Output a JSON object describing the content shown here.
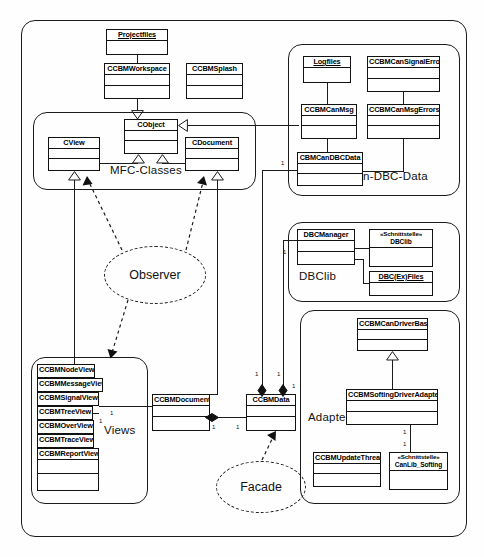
{
  "diagram": {
    "type": "uml-class-diagram",
    "stroke_color": "#1b1b1b",
    "background_color": "#fefefe"
  },
  "packages": [
    {
      "id": "root",
      "label": ""
    },
    {
      "id": "mfc",
      "label": "MFC-Classes"
    },
    {
      "id": "candbc",
      "label": "Can-DBC-Data"
    },
    {
      "id": "dbclib",
      "label": "DBClib"
    },
    {
      "id": "adapter",
      "label": "Adapter"
    },
    {
      "id": "views",
      "label": "Views"
    }
  ],
  "classes": [
    {
      "id": "projectfiles",
      "name": "Projectfiles",
      "stereotype": "",
      "object": true
    },
    {
      "id": "ccbmworkspace",
      "name": "CCBMWorkspace",
      "stereotype": "",
      "object": false
    },
    {
      "id": "ccbmsplash",
      "name": "CCBMSplash",
      "stereotype": "",
      "object": false
    },
    {
      "id": "cobject",
      "name": "CObject",
      "stereotype": "",
      "object": false
    },
    {
      "id": "cview",
      "name": "CView",
      "stereotype": "",
      "object": false
    },
    {
      "id": "cdocument",
      "name": "CDocument",
      "stereotype": "",
      "object": false
    },
    {
      "id": "logfiles",
      "name": "Logfiles",
      "stereotype": "",
      "object": true
    },
    {
      "id": "cansignalerror",
      "name": "CCBMCanSignalError",
      "stereotype": "",
      "object": false
    },
    {
      "id": "canmsg",
      "name": "CCBMCanMsg",
      "stereotype": "",
      "object": false
    },
    {
      "id": "canmsgerrors",
      "name": "CCBMCanMsgErrors",
      "stereotype": "",
      "object": false
    },
    {
      "id": "candbcdata",
      "name": "CBMCanDBCData",
      "stereotype": "",
      "object": false
    },
    {
      "id": "dbcmanager",
      "name": "DBCManager",
      "stereotype": "",
      "object": false
    },
    {
      "id": "dbclibiface",
      "name": "DBClib",
      "stereotype": "«Schnittstelle»",
      "object": false
    },
    {
      "id": "dbcexfiles",
      "name": "DBC(Ex)Files",
      "stereotype": "",
      "object": true
    },
    {
      "id": "candriverbase",
      "name": "CCBMCanDriverBase",
      "stereotype": "",
      "object": false
    },
    {
      "id": "softingadapter",
      "name": "CCBMSoftingDriverAdapter",
      "stereotype": "",
      "object": false
    },
    {
      "id": "updatethread",
      "name": "CCBMUpdateThread",
      "stereotype": "",
      "object": false
    },
    {
      "id": "canlibsofting",
      "name": "CanLib_Softing",
      "stereotype": "«Schnittstelle»",
      "object": false
    },
    {
      "id": "ccbmdocument",
      "name": "CCBMDocument",
      "stereotype": "",
      "object": false
    },
    {
      "id": "ccbmdata",
      "name": "CCBMData",
      "stereotype": "",
      "object": false
    },
    {
      "id": "nodeview",
      "name": "CCBMNodeView",
      "stereotype": "",
      "object": false
    },
    {
      "id": "messageview",
      "name": "CCBMMessageView",
      "stereotype": "",
      "object": false
    },
    {
      "id": "signalview",
      "name": "CCBMSignalView",
      "stereotype": "",
      "object": false
    },
    {
      "id": "treeview",
      "name": "CCBMTreeView",
      "stereotype": "",
      "object": false
    },
    {
      "id": "overview",
      "name": "CCBMOverView",
      "stereotype": "",
      "object": false
    },
    {
      "id": "traceview",
      "name": "CCBMTraceView",
      "stereotype": "",
      "object": false
    },
    {
      "id": "reportview",
      "name": "CCBMReportView",
      "stereotype": "",
      "object": false
    }
  ],
  "patterns": [
    {
      "id": "observer",
      "label": "Observer"
    },
    {
      "id": "facade",
      "label": "Facade"
    }
  ],
  "multiplicities": [
    {
      "id": "m1",
      "value": "1"
    },
    {
      "id": "m2",
      "value": "1"
    },
    {
      "id": "m3",
      "value": "1"
    },
    {
      "id": "m4",
      "value": "1"
    },
    {
      "id": "m5",
      "value": "1"
    },
    {
      "id": "m6",
      "value": "1"
    },
    {
      "id": "m7",
      "value": "1"
    },
    {
      "id": "m8",
      "value": "1"
    },
    {
      "id": "m9",
      "value": "1"
    },
    {
      "id": "m10",
      "value": "1"
    },
    {
      "id": "m11",
      "value": "1"
    },
    {
      "id": "m12",
      "value": "1"
    }
  ]
}
